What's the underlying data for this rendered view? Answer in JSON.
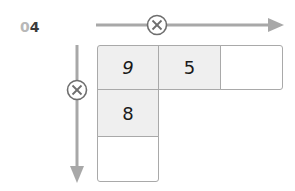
{
  "problem_number": {
    "prefix": "0",
    "digit": "4"
  },
  "operators": {
    "horizontal": {
      "symbol": "⊗",
      "icon": "circled-times-icon"
    },
    "vertical": {
      "symbol": "⊗",
      "icon": "circled-times-icon"
    }
  },
  "grid": {
    "row0": [
      "9",
      "5",
      ""
    ],
    "column0": [
      "9",
      "8",
      ""
    ]
  },
  "colors": {
    "arrow": "#a8a8a8",
    "cell_border": "#a9a9a9",
    "cell_filled": "#efefef",
    "circle_stroke": "#6e6e6e"
  }
}
